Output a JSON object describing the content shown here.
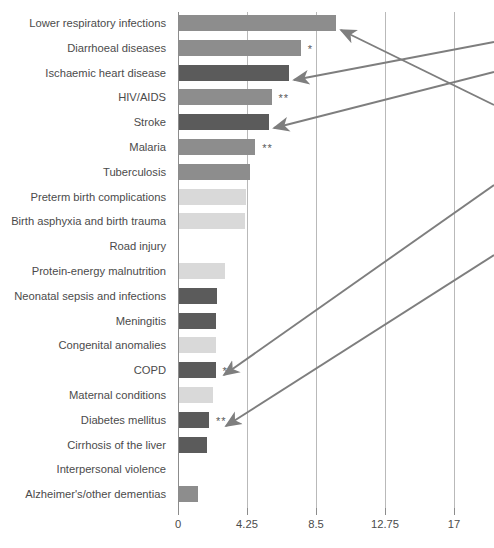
{
  "chart_data": {
    "type": "bar",
    "orientation": "horizontal",
    "title": "",
    "subtitle": "",
    "xlabel": "",
    "ylabel": "",
    "xlim": [
      0,
      17
    ],
    "grid": true,
    "legend": "none",
    "xticks": [
      "0",
      "4.25",
      "8.5",
      "12.75",
      "17"
    ],
    "xtick_values": [
      0,
      4.25,
      8.5,
      12.75,
      17
    ],
    "categories": [
      "Lower respiratory infections",
      "Diarrhoeal diseases",
      "Ischaemic heart disease",
      "HIV/AIDS",
      "Stroke",
      "Malaria",
      "Tuberculosis",
      "Preterm birth complications",
      "Birth asphyxia and birth trauma",
      "Road injury",
      "Protein-energy malnutrition",
      "Neonatal sepsis and infections",
      "Meningitis",
      "Congenital anomalies",
      "COPD",
      "Maternal conditions",
      "Diabetes mellitus",
      "Cirrhosis of the liver",
      "Interpersonal violence",
      "Alzheimer's/other dementias"
    ],
    "values": [
      9.7,
      7.5,
      6.8,
      5.7,
      5.55,
      4.7,
      4.4,
      4.1,
      4.05,
      0.0,
      2.85,
      2.35,
      2.25,
      2.25,
      2.25,
      2.1,
      1.85,
      1.7,
      0.0,
      1.2
    ],
    "bar_shades": [
      "medium",
      "medium",
      "dark",
      "medium",
      "dark",
      "medium",
      "medium",
      "light",
      "light",
      "none",
      "light",
      "dark",
      "dark",
      "light",
      "dark",
      "light",
      "dark",
      "dark",
      "none",
      "medium"
    ],
    "annotations": [
      {
        "category": "Diarrhoeal diseases",
        "marker": "*"
      },
      {
        "category": "HIV/AIDS",
        "marker": "**"
      },
      {
        "category": "Malaria",
        "marker": "**"
      },
      {
        "category": "COPD",
        "marker": "*"
      },
      {
        "category": "Diabetes mellitus",
        "marker": "**"
      }
    ],
    "callout_arrows": [
      {
        "target": "Lower respiratory infections"
      },
      {
        "target": "Ischaemic heart disease"
      },
      {
        "target": "Stroke"
      },
      {
        "target": "COPD"
      },
      {
        "target": "Diabetes mellitus"
      }
    ]
  },
  "colors": {
    "bar_medium": "#8d8d8d",
    "bar_dark": "#5b5b5b",
    "bar_light": "#d9d9d9",
    "gridline": "#b9b9b9",
    "axis": "#8c8c8c",
    "text": "#4b4b4b",
    "arrow": "#7e7e7e",
    "background": "#ffffff"
  }
}
